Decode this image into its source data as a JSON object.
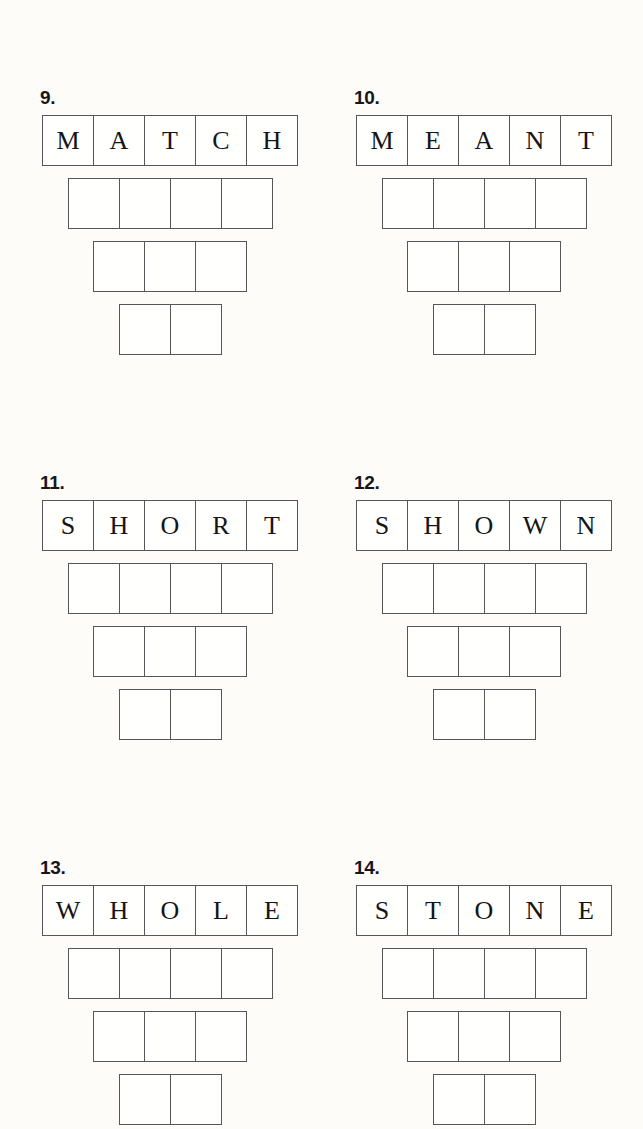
{
  "page": {
    "background_color": "#fdfcf8",
    "grid_line_color": "#56565a",
    "letter_color": "#141417",
    "worksheet_type": "word-ladder"
  },
  "puzzles": [
    {
      "number": "9.",
      "word": "MATCH",
      "letters": [
        "M",
        "A",
        "T",
        "C",
        "H"
      ],
      "rows": [
        5,
        4,
        3,
        2
      ]
    },
    {
      "number": "10.",
      "word": "MEANT",
      "letters": [
        "M",
        "E",
        "A",
        "N",
        "T"
      ],
      "rows": [
        5,
        4,
        3,
        2
      ]
    },
    {
      "number": "11.",
      "word": "SHORT",
      "letters": [
        "S",
        "H",
        "O",
        "R",
        "T"
      ],
      "rows": [
        5,
        4,
        3,
        2
      ]
    },
    {
      "number": "12.",
      "word": "SHOWN",
      "letters": [
        "S",
        "H",
        "O",
        "W",
        "N"
      ],
      "rows": [
        5,
        4,
        3,
        2
      ]
    },
    {
      "number": "13.",
      "word": "WHOLE",
      "letters": [
        "W",
        "H",
        "O",
        "L",
        "E"
      ],
      "rows": [
        5,
        4,
        3,
        2
      ]
    },
    {
      "number": "14.",
      "word": "STONE",
      "letters": [
        "S",
        "T",
        "O",
        "N",
        "E"
      ],
      "rows": [
        5,
        4,
        3,
        2
      ]
    }
  ],
  "layout": {
    "columns": [
      {
        "left": 31
      },
      {
        "left": 345
      }
    ],
    "rows": [
      {
        "top": 88
      },
      {
        "top": 473
      },
      {
        "top": 858
      }
    ]
  }
}
